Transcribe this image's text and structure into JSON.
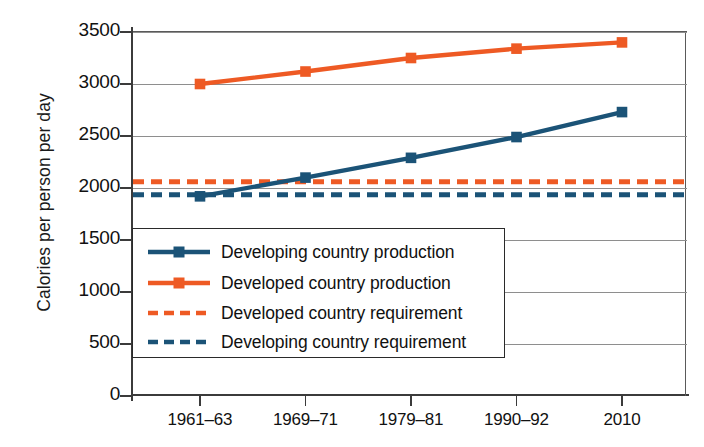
{
  "chart_data": {
    "type": "line",
    "title": "",
    "xlabel": "",
    "ylabel": "Calories per person per day",
    "categories": [
      "1961–63",
      "1969–71",
      "1979–81",
      "1990–92",
      "2010"
    ],
    "ylim": [
      0,
      3500
    ],
    "y_ticks": [
      0,
      500,
      1000,
      1500,
      2000,
      2500,
      3000,
      3500
    ],
    "y_tick_labels": [
      "0",
      "500",
      "1000",
      "1500",
      "2000",
      "2500",
      "3000",
      "3500"
    ],
    "grid": true,
    "grid_axis": "y",
    "legend_position": "lower-left-inside",
    "series": [
      {
        "name": "Developing country production",
        "style": "solid-with-square-markers",
        "color": "#1b5377",
        "values": [
          1920,
          2100,
          2290,
          2490,
          2730
        ]
      },
      {
        "name": "Developed country production",
        "style": "solid-with-square-markers",
        "color": "#ee5a24",
        "values": [
          3000,
          3120,
          3250,
          3340,
          3400
        ]
      },
      {
        "name": "Developed country requirement",
        "style": "dashed-horizontal",
        "color": "#ee5a24",
        "constant_value": 2060
      },
      {
        "name": "Developing country requirement",
        "style": "dashed-horizontal",
        "color": "#1b5377",
        "constant_value": 1935
      }
    ]
  },
  "legend": {
    "items": [
      {
        "label": "Developing country production",
        "color": "#1b5377",
        "dashed": false,
        "marker": true
      },
      {
        "label": "Developed country production",
        "color": "#ee5a24",
        "dashed": false,
        "marker": true
      },
      {
        "label": "Developed country requirement",
        "color": "#ee5a24",
        "dashed": true,
        "marker": false
      },
      {
        "label": "Developing country requirement",
        "color": "#1b5377",
        "dashed": true,
        "marker": false
      }
    ]
  },
  "colors": {
    "developing": "#1b5377",
    "developed": "#ee5a24",
    "axis": "#3b3b3b",
    "gridline": "#8e8e8e",
    "text": "#111111",
    "background": "#ffffff"
  }
}
